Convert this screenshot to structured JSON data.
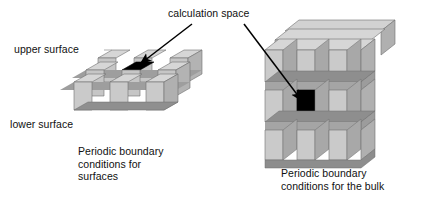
{
  "figure": {
    "title_annotation": "calculation space",
    "labels": {
      "upper_surface": "upper surface",
      "lower_surface": "lower surface"
    },
    "left_panel": {
      "caption_lines": [
        "Periodic boundary",
        "conditions for",
        "surfaces"
      ],
      "structure": "3x3 slab of blocks, one layer thick",
      "highlight": "center top face black"
    },
    "right_panel": {
      "caption_lines": [
        "Periodic boundary",
        "conditions for the bulk"
      ],
      "structure": "3x3x3 cube of blocks",
      "highlight": "center front face black"
    },
    "colors": {
      "block_front": "#c9c9c9",
      "block_side": "#b0b0b0",
      "block_top": "#d6d6d6",
      "gap_shadow": "#8a8a8a",
      "highlight": "#000000",
      "outline": "#555555",
      "background": "#ffffff",
      "text": "#101010",
      "arrow": "#000000"
    }
  }
}
